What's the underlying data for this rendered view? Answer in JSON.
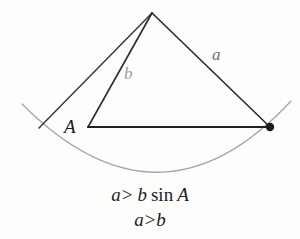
{
  "figure": {
    "type": "geometry-diagram",
    "background_color": "#fdfdfc",
    "stroke_color_dark": "#2b2b2f",
    "stroke_color_light": "#a6a6aa",
    "vertices": {
      "apex": {
        "x": 152,
        "y": 13
      },
      "angle_A": {
        "x": 88,
        "y": 127
      },
      "arc_right_intersection": {
        "x": 270,
        "y": 127
      },
      "arc_left_intersection": {
        "x": 39,
        "y": 128
      }
    },
    "arc": {
      "start": {
        "x": 22,
        "y": 104
      },
      "end": {
        "x": 291,
        "y": 101
      },
      "bottom": {
        "x": 160,
        "y": 170
      },
      "color": "#a6a6aa"
    },
    "point_marker": {
      "x": 270,
      "y": 127,
      "radius": 4,
      "color": "#1b1b1d"
    },
    "labels": {
      "side_a": "a",
      "side_b": "b",
      "angle_A": "A"
    }
  },
  "caption": {
    "line1": {
      "lhs": "a",
      "operator": ">",
      "rhs_var": "b",
      "function": "sin",
      "argument": "A",
      "full_text": "a > b sin A"
    },
    "line2": {
      "lhs": "a",
      "operator": ">",
      "rhs": "b",
      "full_text": "a > b"
    }
  }
}
